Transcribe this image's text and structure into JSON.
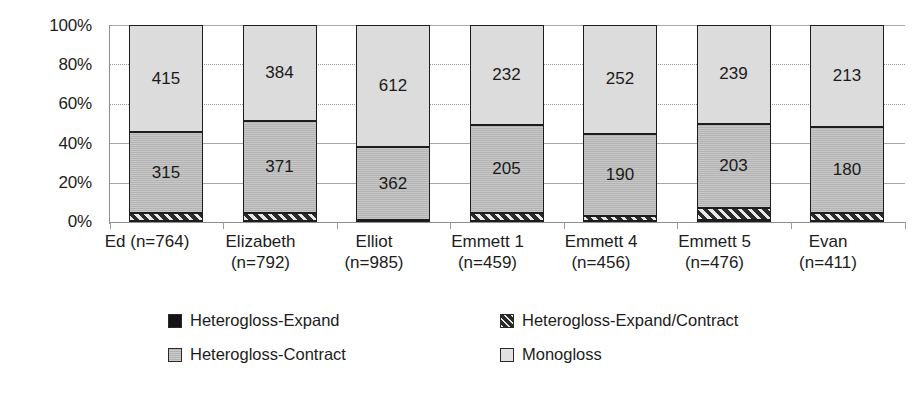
{
  "chart_data": {
    "type": "bar",
    "subtype": "stacked-100-percent",
    "title": "",
    "xlabel": "",
    "ylabel": "",
    "ylim": [
      0,
      100
    ],
    "ytick_labels": [
      "0%",
      "20%",
      "40%",
      "60%",
      "80%",
      "100%"
    ],
    "ytick_values": [
      0,
      20,
      40,
      60,
      80,
      100
    ],
    "grid": true,
    "legend_position": "bottom",
    "categories": [
      "Ed (n=764)",
      "Elizabeth (n=792)",
      "Elliot (n=985)",
      "Emmett 1 (n=459)",
      "Emmett 4 (n=456)",
      "Emmett 5 (n=476)",
      "Evan (n=411)"
    ],
    "category_lines": [
      [
        "Ed (n=764)",
        ""
      ],
      [
        "Elizabeth",
        "(n=792)"
      ],
      [
        "Elliot",
        "(n=985)"
      ],
      [
        "Emmett 1",
        "(n=459)"
      ],
      [
        "Emmett 4",
        "(n=456)"
      ],
      [
        "Emmett 5",
        "(n=476)"
      ],
      [
        "Evan",
        "(n=411)"
      ]
    ],
    "totals": [
      764,
      792,
      985,
      459,
      456,
      476,
      411
    ],
    "series": [
      {
        "name": "Heterogloss-Expand",
        "pattern": "solid-black",
        "color": "#141414",
        "values": [
          5,
          5,
          11,
          3,
          3,
          4,
          3
        ],
        "percents": [
          0.7,
          0.6,
          1.1,
          0.7,
          0.7,
          0.8,
          0.7
        ],
        "labels_shown": false
      },
      {
        "name": "Heterogloss-Expand/Contract",
        "pattern": "diagonal-hatch",
        "color": "#2b2b2b",
        "values": [
          29,
          32,
          0,
          19,
          11,
          30,
          15
        ],
        "percents": [
          3.8,
          4.0,
          0.0,
          4.1,
          2.4,
          6.3,
          3.6
        ],
        "labels_shown": false
      },
      {
        "name": "Heterogloss-Contract",
        "pattern": "medium-gray",
        "color": "#b4b4b4",
        "values": [
          315,
          371,
          362,
          205,
          190,
          203,
          180
        ],
        "percents": [
          41.2,
          46.8,
          36.8,
          44.7,
          41.7,
          42.6,
          43.8
        ],
        "labels_shown": true
      },
      {
        "name": "Monogloss",
        "pattern": "light-gray",
        "color": "#dcdcdc",
        "values": [
          415,
          384,
          612,
          232,
          252,
          239,
          213
        ],
        "percents": [
          54.3,
          48.5,
          62.1,
          50.5,
          55.3,
          50.2,
          51.8
        ],
        "labels_shown": true
      }
    ]
  },
  "legend": {
    "items": [
      {
        "label": "Heterogloss-Expand",
        "swatch": "legend-swatch-black"
      },
      {
        "label": "Heterogloss-Expand/Contract",
        "swatch": "legend-swatch-hatch"
      },
      {
        "label": "Heterogloss-Contract",
        "swatch": "legend-swatch-gray"
      },
      {
        "label": "Monogloss",
        "swatch": "legend-swatch-light"
      }
    ]
  }
}
